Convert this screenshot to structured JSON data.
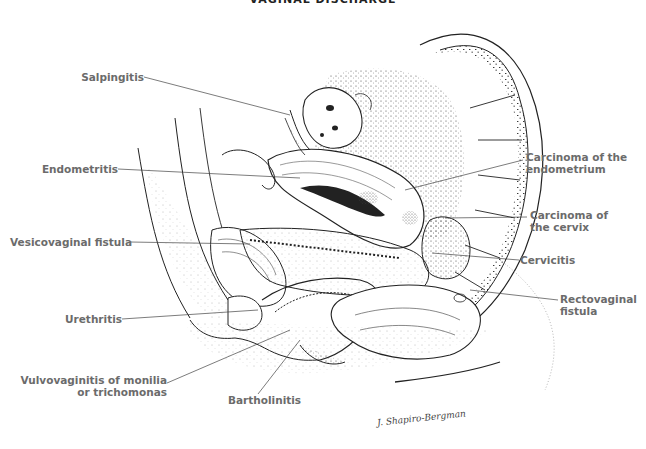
{
  "title": "VAGINAL DISCHARGE",
  "labels": {
    "salpingitis": "Salpingitis",
    "endometritis": "Endometritis",
    "vesicovaginal_fistula": "Vesicovaginal fistula",
    "urethritis": "Urethritis",
    "vulvovaginitis_line1": "Vulvovaginitis of monilia",
    "vulvovaginitis_line2": "or trichomonas",
    "bartholinitis": "Bartholinitis",
    "carcinoma_endometrium_line1": "Carcinoma of the",
    "carcinoma_endometrium_line2": "endometrium",
    "carcinoma_cervix_line1": "Carcinoma of",
    "carcinoma_cervix_line2": "the cervix",
    "cervicitis": "Cervicitis",
    "rectovaginal_line1": "Rectovaginal",
    "rectovaginal_line2": "fistula"
  },
  "signature": "J. Shapiro-Bergman",
  "colors": {
    "label_text": "#6b6b6b",
    "line_art": "#222222",
    "stipple": "#555555"
  }
}
